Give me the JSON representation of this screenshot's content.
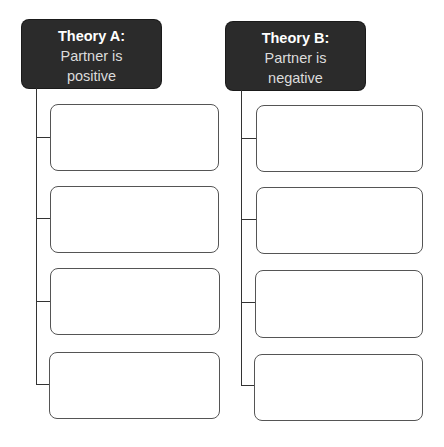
{
  "theories": [
    {
      "title": "Theory A:",
      "line1": "Partner is",
      "line2": "positive",
      "boxes": [
        "",
        "",
        "",
        ""
      ]
    },
    {
      "title": "Theory B:",
      "line1": "Partner is",
      "line2": "negative",
      "boxes": [
        "",
        "",
        "",
        ""
      ]
    }
  ],
  "colors": {
    "header_bg": "#2b2b2b",
    "header_text": "#ffffff",
    "line": "#333333",
    "box_border": "#555555"
  }
}
